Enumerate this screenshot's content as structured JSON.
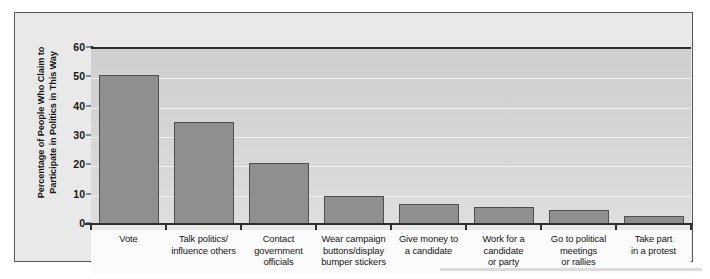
{
  "chart_data": {
    "type": "bar",
    "title": "",
    "xlabel": "",
    "ylabel": "Percentage of People Who Claim to Participate in Politics in This Way",
    "ylim": [
      0,
      60
    ],
    "yticks": [
      0,
      10,
      20,
      30,
      40,
      50,
      60
    ],
    "grid": true,
    "legend": "none",
    "categories": [
      "Vote",
      "Talk politics/ influence others",
      "Contact government officials",
      "Wear campaign buttons/display bumper stickers",
      "Give money to a candidate",
      "Work for a candidate or party",
      "Go to political meetings or rallies",
      "Take part in a protest"
    ],
    "category_lines": [
      [
        "Vote"
      ],
      [
        "Talk politics/",
        "influence others"
      ],
      [
        "Contact",
        "government",
        "officials"
      ],
      [
        "Wear campaign",
        "buttons/display",
        "bumper stickers"
      ],
      [
        "Give money to",
        "a candidate"
      ],
      [
        "Work for a",
        "candidate",
        "or party"
      ],
      [
        "Go to political",
        "meetings",
        "or rallies"
      ],
      [
        "Take part",
        "in a protest"
      ]
    ],
    "values": [
      51,
      35,
      21,
      10,
      7,
      6,
      5,
      3
    ],
    "colors": {
      "bar_fill": "#8f8f8f",
      "bar_border": "#4f4f4f",
      "plot_background": "#d6d6d6",
      "gridline": "#f2f2f2",
      "axis": "#2e2e2e",
      "frame_border": "#58585a",
      "figure_background": "#e9e9e9",
      "label_background": "#fbfbfb",
      "text": "#161616"
    }
  }
}
